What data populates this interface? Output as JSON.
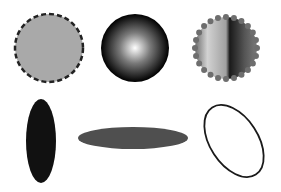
{
  "canvas": {
    "width": 281,
    "height": 192,
    "background": "#ffffff"
  },
  "shapes": [
    {
      "id": "circle-dashed",
      "type": "circle",
      "cx": 49,
      "cy": 48,
      "r": 34,
      "fill": "#a9a9a9",
      "stroke": "#222222",
      "stroke_width": 2.5,
      "stroke_style": "dashed"
    },
    {
      "id": "circle-radial",
      "type": "circle",
      "cx": 135,
      "cy": 48,
      "r": 34,
      "fill": "radial-gradient",
      "gradient_stops": [
        "#ffffff",
        "#8a8a8a",
        "#000000"
      ]
    },
    {
      "id": "circle-linear-dotted",
      "type": "circle",
      "cx": 226,
      "cy": 48,
      "r": 32,
      "fill": "linear-gradient",
      "gradient_stops": [
        "#6e6e6e",
        "#d0d0d0",
        "#a8a8a8",
        "#1a1a1a",
        "#6a6a6a"
      ],
      "stroke": "#6e6e6e",
      "stroke_style": "dotted"
    },
    {
      "id": "ellipse-vertical",
      "type": "ellipse",
      "cx": 41,
      "cy": 141,
      "rx": 15,
      "ry": 42,
      "fill": "#111111"
    },
    {
      "id": "ellipse-horizontal",
      "type": "ellipse",
      "cx": 133,
      "cy": 138,
      "rx": 55,
      "ry": 11,
      "fill": "#4f4f4f"
    },
    {
      "id": "ellipse-outline-rotated",
      "type": "ellipse",
      "cx": 234,
      "cy": 141,
      "rx": 24,
      "ry": 40,
      "rotate": -33,
      "fill": "none",
      "stroke": "#1a1a1a",
      "stroke_width": 1.8
    }
  ]
}
